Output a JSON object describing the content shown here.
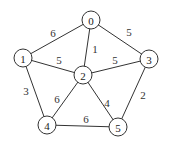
{
  "graph": {
    "nodes": [
      {
        "id": "0",
        "x": 91,
        "y": 20
      },
      {
        "id": "1",
        "x": 23,
        "y": 58
      },
      {
        "id": "2",
        "x": 83,
        "y": 75
      },
      {
        "id": "3",
        "x": 149,
        "y": 59
      },
      {
        "id": "4",
        "x": 47,
        "y": 125
      },
      {
        "id": "5",
        "x": 118,
        "y": 127
      }
    ],
    "edges": [
      {
        "from": "0",
        "to": "1",
        "weight": "6",
        "lx": 53,
        "ly": 33
      },
      {
        "from": "0",
        "to": "2",
        "weight": "1",
        "lx": 95,
        "ly": 49
      },
      {
        "from": "0",
        "to": "3",
        "weight": "5",
        "lx": 129,
        "ly": 32
      },
      {
        "from": "1",
        "to": "2",
        "weight": "5",
        "lx": 59,
        "ly": 60
      },
      {
        "from": "2",
        "to": "3",
        "weight": "5",
        "lx": 115,
        "ly": 60
      },
      {
        "from": "1",
        "to": "4",
        "weight": "3",
        "lx": 26,
        "ly": 91
      },
      {
        "from": "2",
        "to": "4",
        "weight": "6",
        "lx": 57,
        "ly": 99
      },
      {
        "from": "2",
        "to": "5",
        "weight": "4",
        "lx": 107,
        "ly": 103
      },
      {
        "from": "3",
        "to": "5",
        "weight": "2",
        "lx": 143,
        "ly": 95
      },
      {
        "from": "4",
        "to": "5",
        "weight": "6",
        "lx": 86,
        "ly": 119
      }
    ],
    "node_radius": 9
  }
}
